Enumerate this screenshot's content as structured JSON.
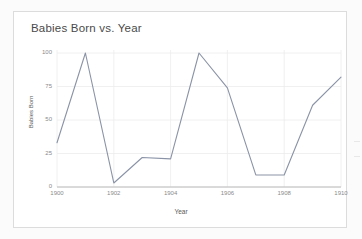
{
  "card": {
    "title": "Babies Born vs. Year"
  },
  "chart_data": {
    "type": "line",
    "title": "Babies Born vs. Year",
    "xlabel": "Year",
    "ylabel": "Babies Born",
    "x": [
      1900,
      1901,
      1902,
      1903,
      1904,
      1905,
      1906,
      1907,
      1908,
      1909,
      1910
    ],
    "values": [
      33,
      100,
      3,
      22,
      21,
      100,
      74,
      9,
      9,
      61,
      82
    ],
    "series": [
      {
        "name": "Babies Born",
        "values": [
          33,
          100,
          3,
          22,
          21,
          100,
          74,
          9,
          9,
          61,
          82
        ]
      }
    ],
    "xlim": [
      1900,
      1910
    ],
    "ylim": [
      0,
      100
    ],
    "xticks": [
      1900,
      1902,
      1904,
      1906,
      1908,
      1910
    ],
    "xtick_labels": [
      "1900",
      "1902",
      "1904",
      "1906",
      "1908",
      "1910"
    ],
    "yticks": [
      0,
      25,
      50,
      75,
      100
    ],
    "ytick_labels": [
      "0",
      "25",
      "50",
      "75",
      "100"
    ],
    "grid": true,
    "legend": false,
    "line_color": "#8a93a6",
    "grid_color": "#ececec",
    "axis_color": "#b4b4b4"
  }
}
